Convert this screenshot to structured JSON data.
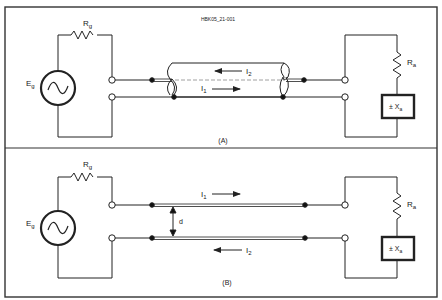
{
  "figure_id": "HBK05_21-001",
  "panels": [
    {
      "label": "(A)",
      "generator": {
        "label": "E",
        "sub": "g"
      },
      "source_resistor": {
        "label": "R",
        "sub": "g"
      },
      "load_resistor": {
        "label": "R",
        "sub": "a"
      },
      "load_reactance": {
        "prefix": "± X",
        "sub": "a"
      },
      "currents": [
        {
          "label": "I",
          "sub": "2",
          "direction": "left"
        },
        {
          "label": "I",
          "sub": "1",
          "direction": "right"
        }
      ],
      "line_type": "coaxial"
    },
    {
      "label": "(B)",
      "generator": {
        "label": "E",
        "sub": "g"
      },
      "source_resistor": {
        "label": "R",
        "sub": "g"
      },
      "load_resistor": {
        "label": "R",
        "sub": "a"
      },
      "load_reactance": {
        "prefix": "± X",
        "sub": "a"
      },
      "currents": [
        {
          "label": "I",
          "sub": "1",
          "direction": "right"
        },
        {
          "label": "I",
          "sub": "2",
          "direction": "left"
        }
      ],
      "spacing_label": "d",
      "line_type": "parallel-wire"
    }
  ],
  "colors": {
    "line": "#222222",
    "border": "#333333",
    "dashed": "#888888"
  }
}
